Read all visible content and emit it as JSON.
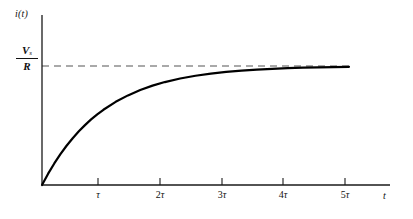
{
  "figure": {
    "kind": "rl-circuit-step-response-plot",
    "background_color": "#ffffff",
    "ink_color": "#111111",
    "curve_color": "#000000",
    "asymptote_color": "#555555",
    "y_axis_label": "i(t)",
    "x_axis_label": "t",
    "asymptote_label": {
      "numerator": "V",
      "numerator_subscript": "s",
      "denominator": "R"
    },
    "tick_labels": [
      {
        "coefficient": "",
        "symbol": "τ"
      },
      {
        "coefficient": "2",
        "symbol": "τ"
      },
      {
        "coefficient": "3",
        "symbol": "τ"
      },
      {
        "coefficient": "4",
        "symbol": "τ"
      },
      {
        "coefficient": "5",
        "symbol": "τ"
      }
    ]
  },
  "chart_data": {
    "type": "line",
    "title": "",
    "subtitle": "",
    "xlabel": "t",
    "ylabel": "i(t)",
    "xlim": [
      0,
      5.7
    ],
    "ylim": [
      0,
      1.12
    ],
    "grid": false,
    "legend": null,
    "x_tick_values": [
      1,
      2,
      3,
      4,
      5
    ],
    "x_tick_labels": [
      "τ",
      "2τ",
      "3τ",
      "4τ",
      "5τ"
    ],
    "y_tick_values": [
      1
    ],
    "y_tick_labels": [
      "Vs/R"
    ],
    "annotations": [
      {
        "kind": "asymptote",
        "style": "dashed",
        "orientation": "horizontal",
        "y": 1,
        "label": "Vs/R"
      }
    ],
    "series": [
      {
        "name": "i(t) = (Vs/R)(1 - e^(-t/τ))",
        "style": "solid",
        "x": [
          0,
          0.1,
          0.2,
          0.3,
          0.4,
          0.5,
          0.6,
          0.7,
          0.8,
          0.9,
          1.0,
          1.2,
          1.4,
          1.6,
          1.8,
          2.0,
          2.25,
          2.5,
          2.75,
          3.0,
          3.25,
          3.5,
          3.75,
          4.0,
          4.25,
          4.5,
          4.75,
          5.0
        ],
        "y": [
          0.0,
          0.095,
          0.181,
          0.259,
          0.33,
          0.393,
          0.451,
          0.503,
          0.551,
          0.593,
          0.632,
          0.699,
          0.753,
          0.798,
          0.835,
          0.865,
          0.895,
          0.918,
          0.936,
          0.95,
          0.961,
          0.97,
          0.976,
          0.982,
          0.986,
          0.989,
          0.991,
          0.993
        ]
      }
    ]
  }
}
